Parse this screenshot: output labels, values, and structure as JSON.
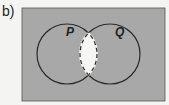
{
  "part_label": "b)",
  "diagram": {
    "type": "venn",
    "sets": [
      {
        "name": "P"
      },
      {
        "name": "Q"
      }
    ],
    "shaded_region": "(P ∩ Q)'",
    "unshaded_region": "P ∩ Q",
    "colors": {
      "shade": "#a8a8a8",
      "unshaded": "#f6f6f4",
      "outline": "#2a2a2a"
    }
  }
}
